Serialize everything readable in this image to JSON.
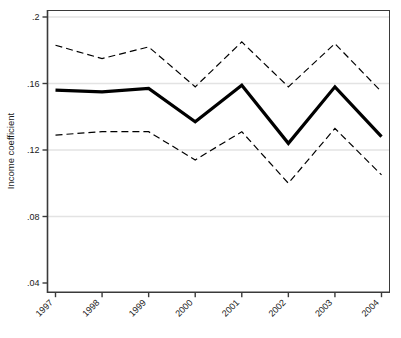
{
  "chart_data": {
    "type": "line",
    "title": "",
    "xlabel": "",
    "ylabel": "Income coefficient",
    "categories": [
      "1997",
      "1998",
      "1999",
      "2000",
      "2001",
      "2002",
      "2003",
      "2004"
    ],
    "ylim": [
      0.04,
      0.2
    ],
    "ytick_values": [
      0.2,
      0.16,
      0.12,
      0.08,
      0.04
    ],
    "ytick_labels": [
      ".2",
      ".16",
      ".12",
      ".08",
      ".04"
    ],
    "grid": "horizontal",
    "legend": "none",
    "series": [
      {
        "name": "Income coefficient (point estimate)",
        "style": "solid",
        "width": 3.2,
        "color": "#000000",
        "values": [
          0.156,
          0.155,
          0.157,
          0.137,
          0.159,
          0.124,
          0.158,
          0.128
        ]
      },
      {
        "name": "Upper confidence bound",
        "style": "dashed",
        "width": 1.2,
        "color": "#000000",
        "values": [
          0.183,
          0.175,
          0.182,
          0.158,
          0.185,
          0.158,
          0.184,
          0.155
        ]
      },
      {
        "name": "Lower confidence bound",
        "style": "dashed",
        "width": 1.2,
        "color": "#000000",
        "values": [
          0.129,
          0.131,
          0.131,
          0.114,
          0.131,
          0.1,
          0.133,
          0.105
        ]
      }
    ]
  },
  "axis": {
    "y_title": "Income coefficient",
    "tick_labels_y": [
      ".2",
      ".16",
      ".12",
      ".08",
      ".04"
    ],
    "tick_labels_x": [
      "1997",
      "1998",
      "1999",
      "2000",
      "2001",
      "2002",
      "2003",
      "2004"
    ],
    "x_label_rotation": "-45"
  },
  "colors": {
    "background": "#ffffff",
    "axis": "#3a3a3a",
    "gridline": "#e3e3e3",
    "line": "#000000"
  }
}
